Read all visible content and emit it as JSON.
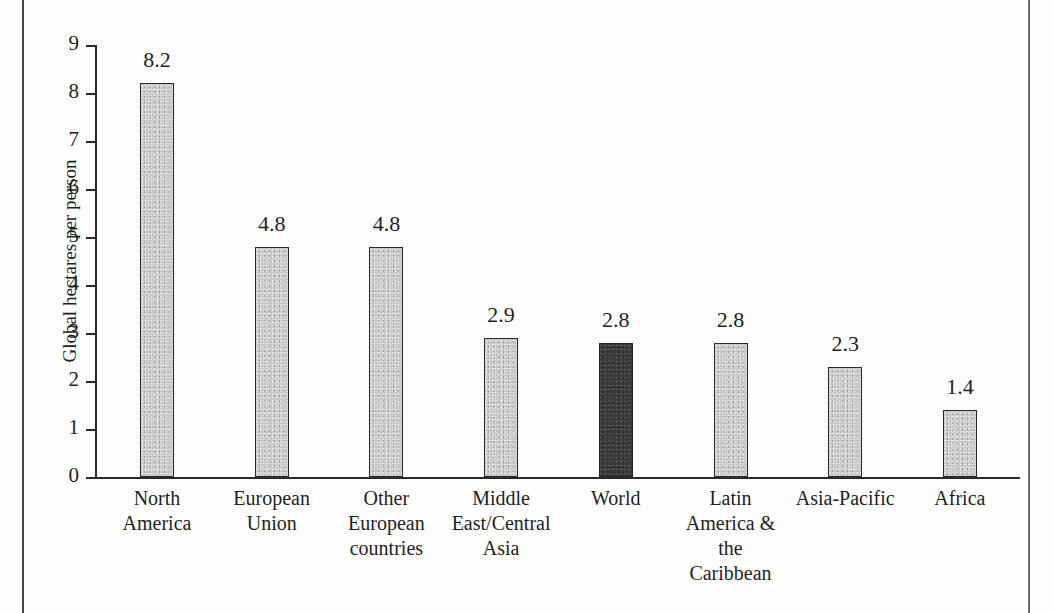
{
  "figure": {
    "background_color": "#fefefe",
    "axis_color": "#2b2b2b",
    "bar_color": "#c9c9c9",
    "highlight_color": "#3b3b3b"
  },
  "chart_data": {
    "type": "bar",
    "title": "",
    "xlabel": "",
    "ylabel": "Global hectares per person",
    "ylim": [
      0,
      9
    ],
    "grid": false,
    "legend": "none",
    "yticks": [
      "0",
      "1",
      "2",
      "3",
      "4",
      "5",
      "6",
      "7",
      "8",
      "9"
    ],
    "categories": [
      "North America",
      "European Union",
      "Other European countries",
      "Middle East/Central Asia",
      "World",
      "Latin America & the Caribbean",
      "Asia-Pacific",
      "Africa"
    ],
    "category_lines": [
      [
        "North",
        "America"
      ],
      [
        "European",
        "Union"
      ],
      [
        "Other",
        "European",
        "countries"
      ],
      [
        "Middle",
        "East/Central",
        "Asia"
      ],
      [
        "World"
      ],
      [
        "Latin",
        "America &",
        "the",
        "Caribbean"
      ],
      [
        "Asia-Pacific"
      ],
      [
        "Africa"
      ]
    ],
    "values": [
      8.2,
      4.8,
      4.8,
      2.9,
      2.8,
      2.8,
      2.3,
      1.4
    ],
    "value_labels": [
      "8.2",
      "4.8",
      "4.8",
      "2.9",
      "2.8",
      "2.8",
      "2.3",
      "1.4"
    ],
    "highlight_index": 4
  }
}
